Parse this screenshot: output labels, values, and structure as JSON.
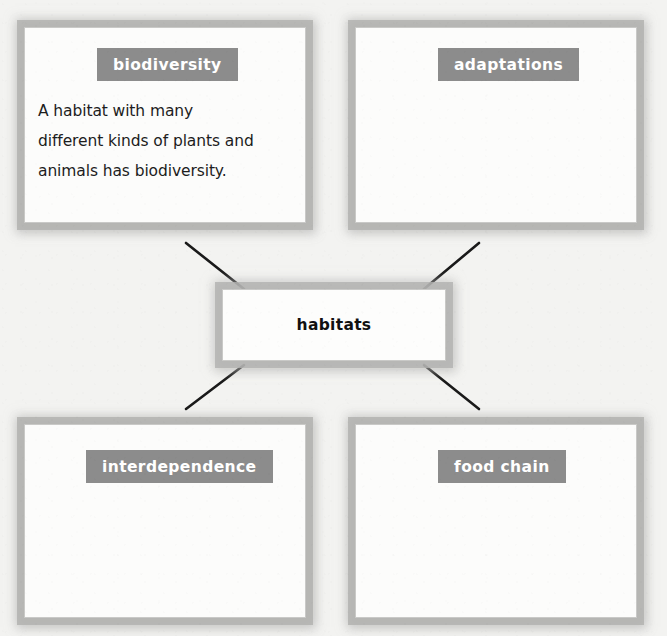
{
  "diagram": {
    "type": "concept-web",
    "background_color": "#f3f3f1",
    "accent_color": "#8c8c8c",
    "text_color": "#1d1d1d",
    "center": {
      "label": "habitats"
    },
    "nodes": [
      {
        "id": "biodiversity",
        "position": "top-left",
        "term": "biodiversity",
        "definition_lines": [
          "A habitat with many",
          "different kinds of plants and",
          "animals has biodiversity."
        ]
      },
      {
        "id": "adaptations",
        "position": "top-right",
        "term": "adaptations",
        "definition_lines": []
      },
      {
        "id": "interdependence",
        "position": "bottom-left",
        "term": "interdependence",
        "definition_lines": []
      },
      {
        "id": "food-chain",
        "position": "bottom-right",
        "term": "food chain",
        "definition_lines": []
      }
    ],
    "connectors": [
      {
        "from": "center",
        "to": "biodiversity",
        "x1": 244,
        "y1": 289,
        "x2": 186,
        "y2": 243
      },
      {
        "from": "center",
        "to": "adaptations",
        "x1": 424,
        "y1": 289,
        "x2": 479,
        "y2": 243
      },
      {
        "from": "center",
        "to": "interdependence",
        "x1": 244,
        "y1": 365,
        "x2": 186,
        "y2": 409
      },
      {
        "from": "center",
        "to": "food-chain",
        "x1": 424,
        "y1": 365,
        "x2": 479,
        "y2": 409
      }
    ]
  }
}
